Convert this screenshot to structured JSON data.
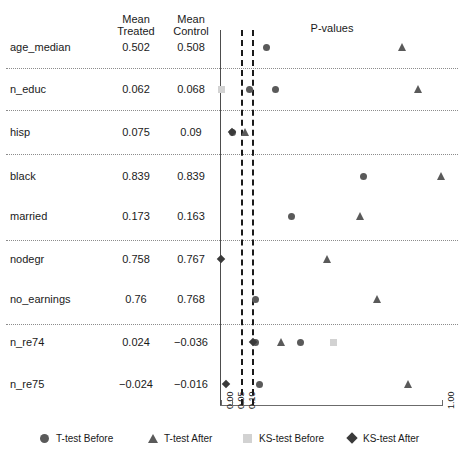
{
  "headers": {
    "mean_treated": "Mean\nTreated",
    "mean_control": "Mean\nControl",
    "plot_title": "P-values"
  },
  "rows": [
    {
      "name": "age_median",
      "mean_treated": "0.502",
      "mean_control": "0.508"
    },
    {
      "name": "n_educ",
      "mean_treated": "0.062",
      "mean_control": "0.068"
    },
    {
      "name": "hisp",
      "mean_treated": "0.075",
      "mean_control": "0.09"
    },
    {
      "name": "black",
      "mean_treated": "0.839",
      "mean_control": "0.839"
    },
    {
      "name": "married",
      "mean_treated": "0.173",
      "mean_control": "0.163"
    },
    {
      "name": "nodegr",
      "mean_treated": "0.758",
      "mean_control": "0.767"
    },
    {
      "name": "no_earnings",
      "mean_treated": "0.76",
      "mean_control": "0.768"
    },
    {
      "name": "n_re74",
      "mean_treated": "0.024",
      "mean_control": "−0.036"
    },
    {
      "name": "n_re75",
      "mean_treated": "−0.024",
      "mean_control": "−0.016"
    }
  ],
  "legend": [
    {
      "label": "T-test Before",
      "marker": "circle",
      "color": "#5a5a5a"
    },
    {
      "label": "T-test After",
      "marker": "triangle",
      "color": "#5a5a5a"
    },
    {
      "label": "KS-test Before",
      "marker": "square",
      "color": "#d2d2d2"
    },
    {
      "label": "KS-test After",
      "marker": "diamond",
      "color": "#3a3a3a"
    }
  ],
  "chart_data": {
    "type": "scatter",
    "title": "P-values",
    "xlabel": "",
    "ylabel": "",
    "xlim": [
      0.0,
      1.0
    ],
    "xticks": [
      "0.00",
      "0.05",
      "0.10",
      "1.00"
    ],
    "xtickvalues": [
      0.0,
      0.05,
      0.1,
      1.0
    ],
    "grid": false,
    "legend_position": "bottom",
    "threshold_lines": [
      0.05,
      0.1
    ],
    "categories": [
      "age_median",
      "n_educ",
      "hisp",
      "black",
      "married",
      "nodegr",
      "no_earnings",
      "n_re74",
      "n_re75"
    ],
    "series": [
      {
        "name": "T-test Before",
        "marker": "circle",
        "points": [
          {
            "category": "age_median",
            "value": 0.21
          },
          {
            "category": "n_educ",
            "value": 0.13
          },
          {
            "category": "n_educ",
            "value": 0.25
          },
          {
            "category": "hisp",
            "value": 0.055
          },
          {
            "category": "black",
            "value": 0.645
          },
          {
            "category": "married",
            "value": 0.32
          },
          {
            "category": "no_earnings",
            "value": 0.16
          },
          {
            "category": "n_re74",
            "value": 0.16
          },
          {
            "category": "n_re74",
            "value": 0.36
          },
          {
            "category": "n_re75",
            "value": 0.175
          }
        ]
      },
      {
        "name": "T-test After",
        "marker": "triangle",
        "points": [
          {
            "category": "age_median",
            "value": 0.825
          },
          {
            "category": "n_educ",
            "value": 0.895
          },
          {
            "category": "hisp",
            "value": 0.115
          },
          {
            "category": "black",
            "value": 1.0
          },
          {
            "category": "married",
            "value": 0.635
          },
          {
            "category": "nodegr",
            "value": 0.485
          },
          {
            "category": "no_earnings",
            "value": 0.71
          },
          {
            "category": "n_re74",
            "value": 0.275
          },
          {
            "category": "n_re75",
            "value": 0.85
          }
        ]
      },
      {
        "name": "KS-test Before",
        "marker": "square",
        "points": [
          {
            "category": "n_educ",
            "value": 0.005
          },
          {
            "category": "n_re74",
            "value": 0.51
          }
        ]
      },
      {
        "name": "KS-test After",
        "marker": "diamond",
        "points": [
          {
            "category": "hisp",
            "value": 0.05
          },
          {
            "category": "nodegr",
            "value": 0.0
          },
          {
            "category": "n_re74",
            "value": 0.145
          },
          {
            "category": "n_re75",
            "value": 0.025
          }
        ]
      }
    ]
  }
}
